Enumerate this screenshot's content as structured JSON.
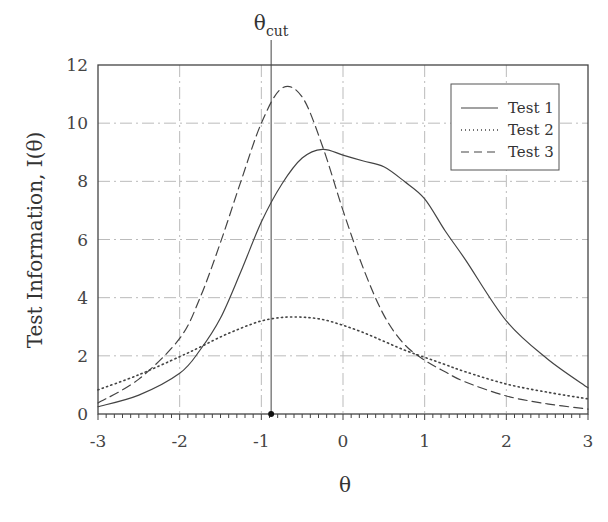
{
  "chart_data": {
    "type": "line",
    "title": "",
    "xlabel": "θ",
    "ylabel": "Test Information, I(θ)",
    "xlim": [
      -3,
      3
    ],
    "ylim": [
      0,
      12
    ],
    "xticks": [
      -3,
      -2,
      -1,
      0,
      1,
      2,
      3
    ],
    "yticks": [
      0,
      2,
      4,
      6,
      8,
      10,
      12
    ],
    "grid": true,
    "legend_position": "upper right",
    "annotations": [
      {
        "type": "vline",
        "x": -0.88,
        "label": "θ",
        "label_sub": "cut",
        "marker_at_axis": true
      }
    ],
    "x": [
      -3,
      -2.5,
      -2,
      -1.75,
      -1.5,
      -1.25,
      -1,
      -0.75,
      -0.5,
      -0.25,
      0,
      0.25,
      0.5,
      0.75,
      1,
      1.25,
      1.5,
      2,
      2.5,
      3
    ],
    "series": [
      {
        "name": "Test 1",
        "style": "solid",
        "values": [
          0.25,
          0.65,
          1.4,
          2.2,
          3.3,
          4.9,
          6.6,
          7.9,
          8.8,
          9.1,
          8.9,
          8.7,
          8.5,
          8.0,
          7.4,
          6.3,
          5.3,
          3.2,
          1.9,
          0.9
        ]
      },
      {
        "name": "Test 2",
        "style": "dotted",
        "values": [
          0.83,
          1.35,
          1.97,
          2.3,
          2.65,
          2.95,
          3.2,
          3.32,
          3.33,
          3.25,
          3.05,
          2.8,
          2.5,
          2.2,
          1.95,
          1.7,
          1.45,
          1.03,
          0.75,
          0.52
        ]
      },
      {
        "name": "Test 3",
        "style": "dashed",
        "values": [
          0.38,
          1.2,
          2.6,
          4.0,
          5.9,
          8.0,
          10.0,
          11.2,
          10.9,
          9.2,
          7.0,
          5.0,
          3.4,
          2.4,
          1.85,
          1.45,
          1.1,
          0.62,
          0.35,
          0.17
        ]
      }
    ]
  },
  "labels": {
    "ylabel": "Test Information, I(θ)",
    "xlabel": "θ",
    "cut_main": "θ",
    "cut_sub": "cut",
    "legend": [
      "Test 1",
      "Test 2",
      "Test 3"
    ]
  }
}
